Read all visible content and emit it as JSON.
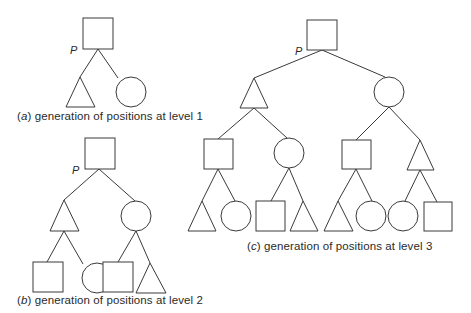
{
  "figure": {
    "panels": [
      {
        "id": "a",
        "label_letter": "a",
        "caption_text": "generation of positions at level 1",
        "root_label": "P",
        "levels": 1,
        "nodes": {
          "root": "square",
          "level1": [
            "triangle",
            "circle"
          ]
        }
      },
      {
        "id": "b",
        "label_letter": "b",
        "caption_text": "generation of positions at level 2",
        "root_label": "P",
        "levels": 2,
        "nodes": {
          "root": "square",
          "level1": [
            "triangle",
            "circle"
          ],
          "level2": [
            "square",
            "circle",
            "square",
            "triangle"
          ]
        }
      },
      {
        "id": "c",
        "label_letter": "c",
        "caption_text": "generation of positions at level 3",
        "root_label": "P",
        "levels": 3,
        "nodes": {
          "root": "square",
          "level1": [
            "triangle",
            "circle"
          ],
          "level2": [
            "square",
            "circle",
            "square",
            "triangle"
          ],
          "level3": [
            "triangle",
            "circle",
            "square",
            "triangle",
            "triangle",
            "circle",
            "circle",
            "square"
          ]
        }
      }
    ],
    "colors": {
      "stroke": "#3a3a3a",
      "background": "#ffffff",
      "text": "#2a2a2a"
    }
  }
}
